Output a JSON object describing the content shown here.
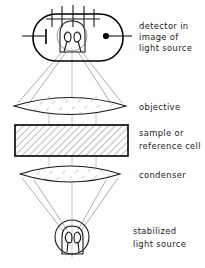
{
  "figure": {
    "width": 205,
    "height": 268,
    "background_color": "#ffffff",
    "line_color": "#000000",
    "ray_color": "#6a6a6a",
    "text_color": "#1a1a1a"
  },
  "labels": {
    "detector_line1": "detector  in",
    "detector_line2": "image of",
    "detector_line3": "light source",
    "objective": "objective",
    "sample_line1": "sample  or",
    "sample_line2": "reference cell",
    "condenser": "condenser",
    "source_line1": "stabilized",
    "source_line2": "light source"
  },
  "components": [
    {
      "id": "detector",
      "name": "photomultiplier-detector",
      "shape": "rounded-capsule",
      "center_x": 78,
      "center_y": 37,
      "label_keys": [
        "detector_line1",
        "detector_line2",
        "detector_line3"
      ],
      "pin_count": 5,
      "has_cathode_bar": true,
      "has_anode_dot": true,
      "has_filament_coil": true
    },
    {
      "id": "objective",
      "name": "objective-lens",
      "shape": "biconvex-lens",
      "center_x": 70,
      "center_y": 106,
      "half_width": 56,
      "half_height": 11,
      "hatched": true,
      "label_keys": [
        "objective"
      ]
    },
    {
      "id": "sample_cell",
      "name": "sample-or-reference-cell",
      "shape": "hatched-rectangle",
      "x": 15,
      "y": 125,
      "width": 113,
      "height": 31,
      "hatched": true,
      "label_keys": [
        "sample_line1",
        "sample_line2"
      ]
    },
    {
      "id": "condenser",
      "name": "condenser-lens",
      "shape": "biconvex-lens",
      "center_x": 70,
      "center_y": 174,
      "half_width": 50,
      "half_height": 10,
      "hatched": true,
      "label_keys": [
        "condenser"
      ]
    },
    {
      "id": "light_source",
      "name": "stabilized-light-source",
      "shape": "lamp-circle",
      "center_x": 72,
      "center_y": 237,
      "radius": 17,
      "has_filament_coil": true,
      "label_keys": [
        "source_line1",
        "source_line2"
      ]
    }
  ],
  "optical_axis": {
    "x": 72,
    "top_y": 48,
    "bottom_y": 258
  },
  "label_positions": [
    {
      "key": "detector_line1",
      "x": 139,
      "y": 26
    },
    {
      "key": "detector_line2",
      "x": 139,
      "y": 37
    },
    {
      "key": "detector_line3",
      "x": 139,
      "y": 48
    },
    {
      "key": "objective",
      "x": 139,
      "y": 107
    },
    {
      "key": "sample_line1",
      "x": 139,
      "y": 133
    },
    {
      "key": "sample_line2",
      "x": 139,
      "y": 146
    },
    {
      "key": "condenser",
      "x": 139,
      "y": 175
    },
    {
      "key": "source_line1",
      "x": 133,
      "y": 231
    },
    {
      "key": "source_line2",
      "x": 133,
      "y": 244
    }
  ]
}
